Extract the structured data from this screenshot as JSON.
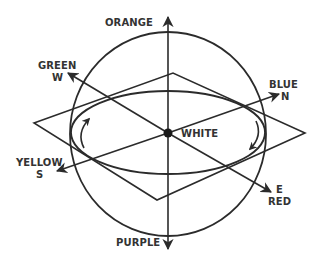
{
  "diagram": {
    "type": "3d-direction-sphere",
    "stroke_color": "#2b2b2b",
    "center_label": "WHITE",
    "axes": {
      "up": {
        "color_name": "ORANGE"
      },
      "down": {
        "color_name": "PURPLE"
      },
      "upper_left": {
        "color_name": "GREEN",
        "compass": "W"
      },
      "upper_right": {
        "color_name": "BLUE",
        "compass": "N"
      },
      "lower_left": {
        "color_name": "YELLOW",
        "compass": "S"
      },
      "lower_right": {
        "color_name": "RED",
        "compass": "E"
      }
    },
    "rotation_arrows": [
      "counterclockwise-left",
      "clockwise-right"
    ]
  }
}
